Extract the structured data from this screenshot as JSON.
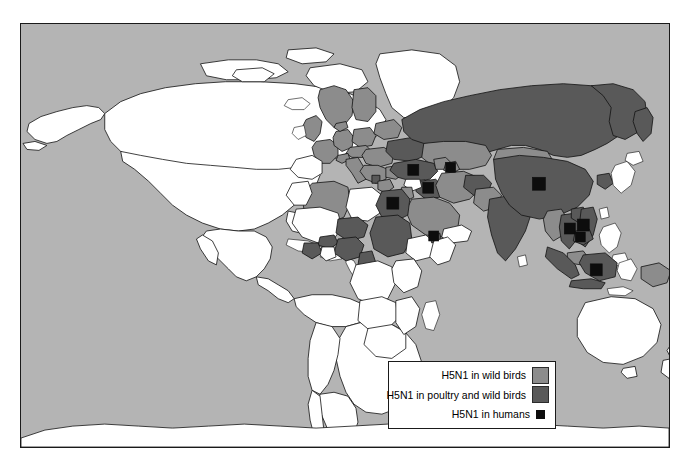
{
  "figure": {
    "kind": "world-choropleth-map",
    "background_color": "#ffffff",
    "ocean_color": "#b4b4b4",
    "frame_border_color": "#1a1a1a"
  },
  "legend": {
    "background_color": "#ffffff",
    "border_color": "#1a1a1a",
    "entries": [
      {
        "label": "H5N1 in wild birds",
        "swatch_color": "#8c8c8c",
        "swatch_shape": "square-large",
        "key": "wild"
      },
      {
        "label": "H5N1 in poultry and wild birds",
        "swatch_color": "#595959",
        "swatch_shape": "square-large",
        "key": "poultry"
      },
      {
        "label": "H5N1 in humans",
        "swatch_color": "#0d0d0d",
        "swatch_shape": "square-small",
        "key": "humans"
      }
    ]
  },
  "map_data": {
    "type": "choropleth",
    "categories": [
      "none",
      "wild",
      "poultry",
      "humans"
    ],
    "colors": {
      "none": "#ffffff",
      "wild": "#8c8c8c",
      "poultry": "#595959",
      "humans": "#0d0d0d",
      "ocean": "#b4b4b4"
    },
    "regions_wild_birds": [
      "United Kingdom",
      "France",
      "Germany",
      "Poland",
      "Czechia",
      "Slovakia",
      "Austria",
      "Hungary",
      "Slovenia",
      "Croatia",
      "Bosnia",
      "Serbia",
      "Italy",
      "Greece",
      "Bulgaria",
      "Romania",
      "Ukraine",
      "Denmark",
      "Sweden",
      "Switzerland",
      "Mongolia",
      "Kazakhstan",
      "Iran",
      "Saudi Arabia",
      "Jordan",
      "Israel",
      "Algeria",
      "Azerbaijan",
      "Georgia",
      "Pakistan",
      "Myanmar",
      "Malaysia",
      "Papua New Guinea"
    ],
    "regions_poultry_and_wild_birds": [
      "Russia",
      "China",
      "India",
      "Vietnam",
      "Thailand",
      "Cambodia",
      "Laos",
      "Indonesia",
      "Turkey",
      "Iraq",
      "Egypt",
      "Sudan",
      "Nigeria",
      "Niger",
      "Burkina Faso",
      "Ivory Coast",
      "Cameroon",
      "Djibouti",
      "Afghanistan",
      "Ukraine-east",
      "Romania-east",
      "Albania",
      "Bangladesh"
    ],
    "regions_humans_markers": [
      "China",
      "Turkey",
      "Iraq",
      "Egypt",
      "Azerbaijan",
      "Djibouti",
      "Vietnam",
      "Thailand",
      "Cambodia",
      "Indonesia"
    ],
    "regions_unaffected": [
      "Canada",
      "United States",
      "Mexico",
      "Greenland",
      "Brazil",
      "Argentina",
      "Chile",
      "Peru",
      "Colombia",
      "Venezuela",
      "Bolivia",
      "Australia",
      "New Zealand",
      "South Africa",
      "Kenya",
      "Tanzania",
      "Congo",
      "Angola",
      "Antarctica"
    ]
  }
}
